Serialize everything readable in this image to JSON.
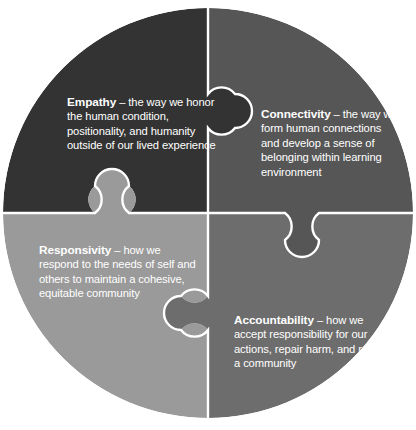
{
  "diagram": {
    "type": "four-piece-jigsaw-circle",
    "title": "",
    "background_color": "#ffffff",
    "seam_color": "#ffffff",
    "text_color": "#ffffff",
    "circle": {
      "center_x": 208,
      "center_y": 213,
      "radius": 205
    },
    "pieces": [
      {
        "id": "empathy",
        "position": "top-left",
        "term": "Empathy",
        "dash": " – ",
        "description": "the way we honor the human condition, positionality, and humanity outside of our lived experience",
        "full_text": "Empathy – the way we honor the human condition, positionality, and humanity outside of our lived experience",
        "color": "#333333"
      },
      {
        "id": "connectivity",
        "position": "top-right",
        "term": "Connectivity",
        "dash": " – ",
        "description": "the way we form human connections and develop a sense of belonging within learning environment",
        "full_text": "Connectivity – the way we form human connections and develop a sense of belonging within learning environment",
        "color": "#565656"
      },
      {
        "id": "responsivity",
        "position": "bottom-left",
        "term": "Responsivity",
        "dash": " – ",
        "description": "how we respond to the needs of self and others to maintain a cohesive, equitable community",
        "full_text": "Responsivity – how we respond to the needs of self and others to maintain a cohesive, equitable community",
        "color": "#9a9a9a"
      },
      {
        "id": "accountability",
        "position": "bottom-right",
        "term": "Accountability",
        "dash": " – ",
        "description": "how we accept responsibility for our actions, repair harm, and restore a community",
        "full_text": "Accountability – how we accept responsibility for our actions, repair harm, and restore a community",
        "color": "#6d6d6d"
      }
    ],
    "tabs": [
      {
        "id": "tab-empathy-to-connectivity",
        "from": "empathy",
        "to": "connectivity",
        "cx": 235,
        "cy": 111,
        "r": 17
      },
      {
        "id": "tab-responsivity-to-empathy",
        "from": "responsivity",
        "to": "empathy",
        "cx": 112,
        "cy": 186,
        "r": 17
      },
      {
        "id": "tab-connectivity-to-accountability",
        "from": "connectivity",
        "to": "accountability",
        "cx": 302,
        "cy": 240,
        "r": 17
      },
      {
        "id": "tab-accountability-to-responsivity",
        "from": "accountability",
        "to": "responsivity",
        "cx": 181,
        "cy": 313,
        "r": 17
      }
    ]
  }
}
